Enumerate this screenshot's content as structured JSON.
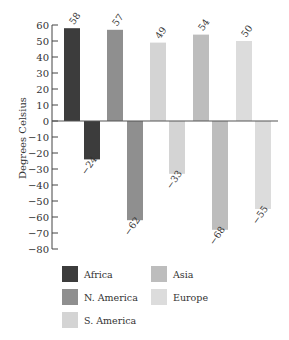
{
  "chart_data": {
    "type": "bar",
    "title": "",
    "xlabel": "",
    "ylabel": "Degrees Celsius",
    "ylim": [
      -80,
      60
    ],
    "yticks": [
      60,
      50,
      40,
      30,
      20,
      10,
      0,
      -10,
      -20,
      -30,
      -40,
      -50,
      -60,
      -70,
      -80
    ],
    "grid": false,
    "legend_position": "bottom",
    "categories": [
      "Africa",
      "N. America",
      "S. America",
      "Asia",
      "Europe"
    ],
    "series": [
      {
        "name": "Highest temperature",
        "values": [
          58,
          57,
          49,
          54,
          50
        ]
      },
      {
        "name": "Lowest temperature",
        "values": [
          -24,
          -62,
          -33,
          -68,
          -55
        ]
      }
    ],
    "data_labels": {
      "high": [
        "58",
        "57",
        "49",
        "54",
        "50"
      ],
      "low": [
        "−24",
        "−62",
        "−33",
        "−68",
        "−55"
      ]
    },
    "colors": {
      "Africa": "#3c3c3c",
      "N. America": "#8f8f8f",
      "S. America": "#d4d4d4",
      "Asia": "#bdbdbd",
      "Europe": "#dcdcdc"
    }
  },
  "legend": {
    "items": [
      {
        "label": "Africa",
        "color": "#3c3c3c"
      },
      {
        "label": "N. America",
        "color": "#8f8f8f"
      },
      {
        "label": "S. America",
        "color": "#d4d4d4"
      },
      {
        "label": "Asia",
        "color": "#bdbdbd"
      },
      {
        "label": "Europe",
        "color": "#dcdcdc"
      }
    ]
  }
}
